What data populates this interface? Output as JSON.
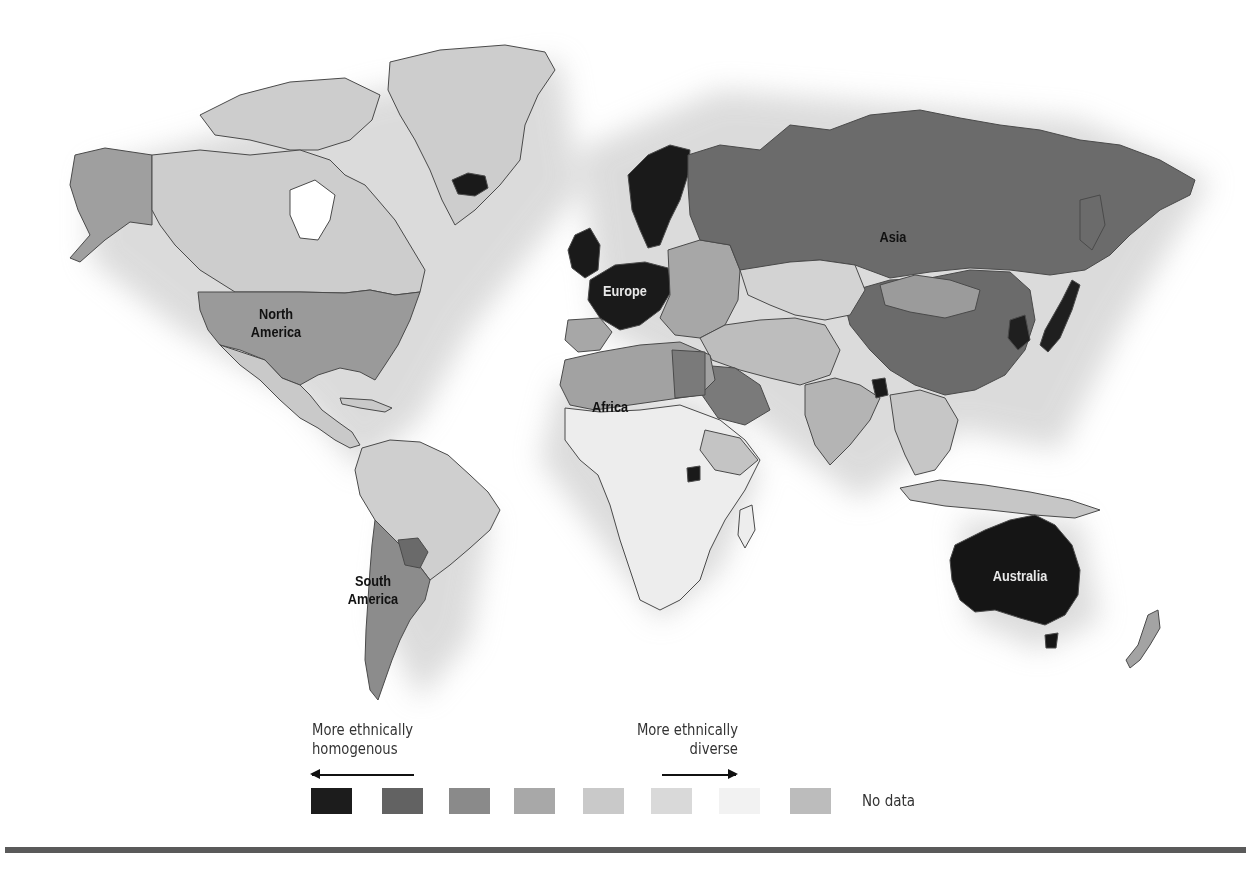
{
  "map": {
    "title": "World map of ethnic diversity",
    "region_labels": {
      "north_america": [
        "North",
        "America"
      ],
      "south_america": [
        "South",
        "America"
      ],
      "europe": "Europe",
      "africa": "Africa",
      "asia": "Asia",
      "australia": "Australia"
    },
    "region_shading": {
      "north_america_usa": "#9a9a9a",
      "canada_greenland": "#cdcdcd",
      "alaska": "#9f9f9f",
      "central_america": "#c9c9c9",
      "south_america_north": "#cfcfcf",
      "argentina_chile": "#8c8c8c",
      "europe_west": "#1a1a1a",
      "europe_east": "#a7a7a7",
      "russia_china": "#6b6b6b",
      "central_asia": "#d3d3d3",
      "mongolia": "#9b9b9b",
      "middle_east": "#bdbdbd",
      "saudi_egypt": "#7a7a7a",
      "north_africa": "#a2a2a2",
      "sub_saharan_africa": "#ededed",
      "india": "#b4b4b4",
      "southeast_asia": "#c6c6c6",
      "japan_korea": "#1f1f1f",
      "australia": "#151515",
      "new_zealand": "#a3a3a3",
      "iceland": "#1a1a1a"
    }
  },
  "legend": {
    "left_label": [
      "More ethnically",
      "homogenous"
    ],
    "right_label": [
      "More ethnically",
      "diverse"
    ],
    "left_arrow": "arrow-left",
    "right_arrow": "arrow-right",
    "swatches": [
      {
        "color": "#1c1c1c",
        "meaning": "most homogenous"
      },
      {
        "color": "#626262",
        "meaning": "level 2"
      },
      {
        "color": "#8a8a8a",
        "meaning": "level 3"
      },
      {
        "color": "#a8a8a8",
        "meaning": "level 4"
      },
      {
        "color": "#c9c9c9",
        "meaning": "level 5"
      },
      {
        "color": "#d9d9d9",
        "meaning": "level 6"
      },
      {
        "color": "#f2f2f2",
        "meaning": "most diverse"
      },
      {
        "color": "#bcbcbc",
        "meaning": "no data"
      }
    ],
    "no_data_label": "No data"
  }
}
